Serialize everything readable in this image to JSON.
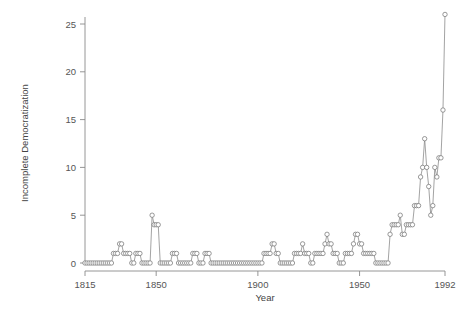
{
  "figure": {
    "background_color": "#ffffff",
    "line_color": "#8c8c8c",
    "marker_fill": "#ffffff",
    "marker_stroke": "#6f6f6f",
    "axis_color": "#8a8a8a",
    "text_color": "#555555"
  },
  "axes": {
    "x_title": "Year",
    "y_title": "Incomplete Democratization",
    "x_ticks": [
      "1815",
      "1850",
      "1900",
      "1950",
      "1992"
    ],
    "y_ticks": [
      "0",
      "5",
      "10",
      "15",
      "20",
      "25"
    ]
  },
  "chart_data": {
    "type": "line",
    "title": "",
    "subtitle": "",
    "xlabel": "Year",
    "ylabel": "Incomplete Democratization",
    "xlim": [
      1815,
      1992
    ],
    "ylim": [
      0,
      26
    ],
    "xticks": [
      1815,
      1850,
      1900,
      1950,
      1992
    ],
    "yticks": [
      0,
      5,
      10,
      15,
      20,
      25
    ],
    "grid": false,
    "legend": "none",
    "marker": "open-circle",
    "series": [
      {
        "name": "Incomplete Democratization",
        "x": [
          1815,
          1816,
          1817,
          1818,
          1819,
          1820,
          1821,
          1822,
          1823,
          1824,
          1825,
          1826,
          1827,
          1828,
          1829,
          1830,
          1831,
          1832,
          1833,
          1834,
          1835,
          1836,
          1837,
          1838,
          1839,
          1840,
          1841,
          1842,
          1843,
          1844,
          1845,
          1846,
          1847,
          1848,
          1849,
          1850,
          1851,
          1852,
          1853,
          1854,
          1855,
          1856,
          1857,
          1858,
          1859,
          1860,
          1861,
          1862,
          1863,
          1864,
          1865,
          1866,
          1867,
          1868,
          1869,
          1870,
          1871,
          1872,
          1873,
          1874,
          1875,
          1876,
          1877,
          1878,
          1879,
          1880,
          1881,
          1882,
          1883,
          1884,
          1885,
          1886,
          1887,
          1888,
          1889,
          1890,
          1891,
          1892,
          1893,
          1894,
          1895,
          1896,
          1897,
          1898,
          1899,
          1900,
          1901,
          1902,
          1903,
          1904,
          1905,
          1906,
          1907,
          1908,
          1909,
          1910,
          1911,
          1912,
          1913,
          1914,
          1915,
          1916,
          1917,
          1918,
          1919,
          1920,
          1921,
          1922,
          1923,
          1924,
          1925,
          1926,
          1927,
          1928,
          1929,
          1930,
          1931,
          1932,
          1933,
          1934,
          1935,
          1936,
          1937,
          1938,
          1939,
          1940,
          1941,
          1942,
          1943,
          1944,
          1945,
          1946,
          1947,
          1948,
          1949,
          1950,
          1951,
          1952,
          1953,
          1954,
          1955,
          1956,
          1957,
          1958,
          1959,
          1960,
          1961,
          1962,
          1963,
          1964,
          1965,
          1966,
          1967,
          1968,
          1969,
          1970,
          1971,
          1972,
          1973,
          1974,
          1975,
          1976,
          1977,
          1978,
          1979,
          1980,
          1981,
          1982,
          1983,
          1984,
          1985,
          1986,
          1987,
          1988,
          1989,
          1990,
          1991,
          1992
        ],
        "values": [
          0,
          0,
          0,
          0,
          0,
          0,
          0,
          0,
          0,
          0,
          0,
          0,
          0,
          0,
          1,
          1,
          1,
          2,
          2,
          1,
          1,
          1,
          1,
          0,
          0,
          1,
          1,
          1,
          0,
          0,
          0,
          0,
          0,
          5,
          4,
          4,
          4,
          0,
          0,
          0,
          0,
          0,
          0,
          1,
          1,
          1,
          0,
          0,
          0,
          0,
          0,
          0,
          0,
          1,
          1,
          1,
          0,
          0,
          0,
          1,
          1,
          1,
          0,
          0,
          0,
          0,
          0,
          0,
          0,
          0,
          0,
          0,
          0,
          0,
          0,
          0,
          0,
          0,
          0,
          0,
          0,
          0,
          0,
          0,
          0,
          0,
          0,
          0,
          1,
          1,
          1,
          1,
          2,
          2,
          1,
          1,
          0,
          0,
          0,
          0,
          0,
          0,
          0,
          1,
          1,
          1,
          1,
          2,
          1,
          1,
          1,
          0,
          0,
          1,
          1,
          1,
          1,
          1,
          2,
          3,
          2,
          2,
          1,
          1,
          1,
          0,
          0,
          0,
          1,
          1,
          1,
          1,
          2,
          3,
          3,
          2,
          2,
          1,
          1,
          1,
          1,
          1,
          1,
          0,
          0,
          0,
          0,
          0,
          0,
          0,
          3,
          4,
          4,
          4,
          4,
          5,
          3,
          3,
          4,
          4,
          4,
          4,
          6,
          6,
          6,
          9,
          10,
          13,
          10,
          8,
          5,
          6,
          10,
          9,
          11,
          11,
          16,
          26
        ]
      }
    ]
  }
}
